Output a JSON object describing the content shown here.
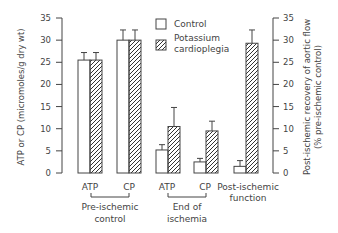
{
  "chart_data": {
    "type": "bar",
    "title": "",
    "ylabel_left": "ATP or CP (micromoles/g dry wt)",
    "ylabel_right_line1": "Post-ischemic recovery of aortic flow",
    "ylabel_right_line2": "(% pre-ischemic control)",
    "ylim_left": [
      0,
      35
    ],
    "ylim_right": [
      0,
      35
    ],
    "yticks": [
      0,
      5,
      10,
      15,
      20,
      25,
      30,
      35
    ],
    "grid": false,
    "legend_position": "top-center",
    "legend": [
      {
        "name": "Control",
        "fill": "open"
      },
      {
        "name": "Potassium cardioplegia",
        "fill": "hatched"
      }
    ],
    "categories": [
      "ATP",
      "CP",
      "ATP",
      "CP",
      "Post-ischemic function"
    ],
    "category_groups": [
      {
        "label_line1": "Pre-ischemic",
        "label_line2": "control",
        "members": [
          "ATP",
          "CP"
        ]
      },
      {
        "label_line1": "End of",
        "label_line2": "ischemia",
        "members": [
          "ATP",
          "CP"
        ]
      }
    ],
    "series": [
      {
        "name": "Control",
        "values": [
          25.5,
          30.0,
          5.2,
          2.5,
          1.5
        ],
        "errors": [
          1.7,
          2.3,
          1.2,
          0.8,
          1.3
        ]
      },
      {
        "name": "Potassium cardioplegia",
        "values": [
          25.5,
          30.0,
          10.5,
          9.5,
          29.3
        ],
        "errors": [
          1.7,
          2.3,
          4.3,
          2.2,
          3.0
        ]
      }
    ],
    "axis_note": "First four categories use left axis; Post-ischemic function uses right axis"
  },
  "labels": {
    "legend_control": "Control",
    "legend_k1": "Potassium",
    "legend_k2": "cardioplegia",
    "cat_atp1": "ATP",
    "cat_cp1": "CP",
    "cat_atp2": "ATP",
    "cat_cp2": "CP",
    "cat_post1": "Post-ischemic",
    "cat_post2": "function",
    "grp1_l1": "Pre-ischemic",
    "grp1_l2": "control",
    "grp2_l1": "End of",
    "grp2_l2": "ischemia",
    "ylabel_left": "ATP or CP (micromoles/g dry wt)",
    "ylabel_right1": "Post-ischemic recovery of aortic flow",
    "ylabel_right2": "(% pre-ischemic control)"
  }
}
